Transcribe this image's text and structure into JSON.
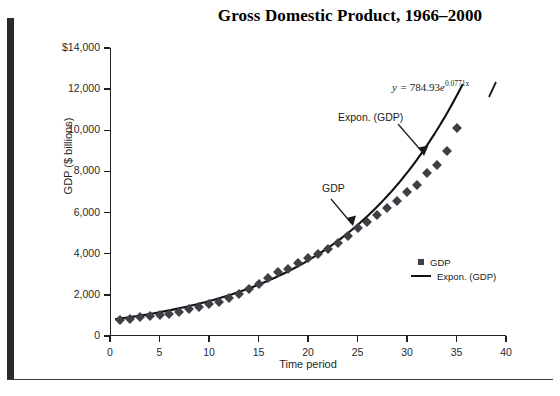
{
  "figure": {
    "title": "Gross Domestic Product, 1966–2000",
    "cut_header_text": " "
  },
  "legend": {
    "position": "inside-right",
    "items": [
      {
        "label": "GDP",
        "marker": "square",
        "color": "#3f3f46"
      },
      {
        "label": "Expon. (GDP)",
        "marker": "line",
        "color": "#111111"
      }
    ]
  },
  "annotations": {
    "equation_prefix": "y = ",
    "equation_coef": "784.93",
    "equation_base": "e",
    "equation_exponent": "0.0771x",
    "equation_full": "y = 784.93e^{0.0771x}",
    "series_label": "GDP",
    "trend_label": "Expon. (GDP)"
  },
  "chart_data": {
    "type": "scatter",
    "title": "Gross Domestic Product, 1966–2000",
    "subtitle": "",
    "xlabel": "Time period",
    "ylabel": "GDP ($ billions)",
    "xlim": [
      0,
      40
    ],
    "ylim": [
      0,
      14000
    ],
    "xticks": [
      0,
      5,
      10,
      15,
      20,
      25,
      30,
      35,
      40
    ],
    "xtick_labels": [
      "0",
      "5",
      "10",
      "15",
      "20",
      "25",
      "30",
      "35",
      "40"
    ],
    "yticks": [
      0,
      2000,
      4000,
      6000,
      8000,
      10000,
      12000,
      14000
    ],
    "ytick_labels": [
      "0",
      "2,000",
      "4,000",
      "6,000",
      "8,000",
      "10,000",
      "12,000",
      "$14,000"
    ],
    "grid": false,
    "legend_position": "inside-right",
    "series": [
      {
        "name": "GDP",
        "type": "scatter",
        "marker": "diamond",
        "color": "#3f3f46",
        "x": [
          1,
          2,
          3,
          4,
          5,
          6,
          7,
          8,
          9,
          10,
          11,
          12,
          13,
          14,
          15,
          16,
          17,
          18,
          19,
          20,
          21,
          22,
          23,
          24,
          25,
          26,
          27,
          28,
          29,
          30,
          31,
          32,
          33,
          34,
          35
        ],
        "y": [
          790,
          835,
          900,
          980,
          1040,
          1090,
          1180,
          1300,
          1430,
          1550,
          1650,
          1840,
          2030,
          2290,
          2550,
          2800,
          3130,
          3260,
          3530,
          3780,
          4010,
          4230,
          4530,
          4880,
          5250,
          5540,
          5890,
          6240,
          6580,
          6990,
          7350,
          7940,
          8330,
          9000,
          10100
        ]
      },
      {
        "name": "Expon. (GDP)",
        "type": "line",
        "color": "#111111",
        "fit": "exponential",
        "equation": "y = 784.93e^{0.0771x}",
        "coefficient": 784.93,
        "rate": 0.0771
      }
    ]
  }
}
